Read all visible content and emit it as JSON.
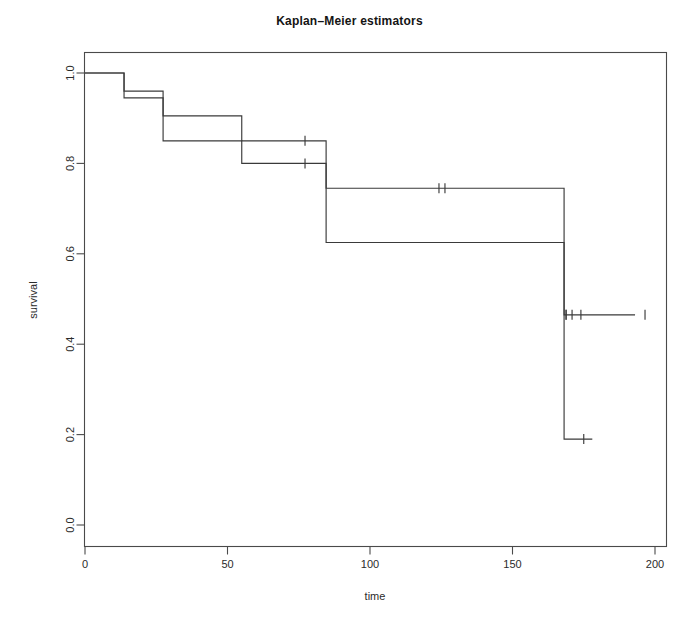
{
  "chart_data": {
    "type": "line",
    "subtype": "kaplan-meier-step",
    "title": "Kaplan–Meier estimators",
    "xlabel": "time",
    "ylabel": "survival",
    "xlim": [
      0,
      200
    ],
    "ylim": [
      0.0,
      1.0
    ],
    "xticks": [
      0,
      50,
      100,
      150,
      200
    ],
    "xtick_labels": [
      "0",
      "50",
      "100",
      "150",
      "200"
    ],
    "yticks": [
      0.0,
      0.2,
      0.4,
      0.6,
      0.8,
      1.0
    ],
    "ytick_labels": [
      "0.0",
      "0.2",
      "0.4",
      "0.6",
      "0.8",
      "1.0"
    ],
    "grid": false,
    "legend": "none",
    "line_color": "#3a3a3a",
    "frame_color": "#4a4a4a",
    "series": [
      {
        "name": "group-1",
        "x": [
          0,
          13.7,
          27.4,
          55.0,
          84.6,
          168.1,
          193.0
        ],
        "y": [
          1.0,
          0.96,
          0.905,
          0.85,
          0.745,
          0.465,
          0.465
        ],
        "censor_x": [
          77.2,
          124.2,
          126.3,
          168.8,
          170.9,
          174.0,
          196.5
        ],
        "censor_y": [
          0.85,
          0.745,
          0.745,
          0.465,
          0.465,
          0.465,
          0.465
        ]
      },
      {
        "name": "group-2",
        "x": [
          0,
          13.7,
          27.4,
          55.0,
          84.6,
          168.1,
          178.0
        ],
        "y": [
          1.0,
          0.945,
          0.85,
          0.8,
          0.625,
          0.19,
          0.19
        ],
        "censor_x": [
          77.2,
          168.8,
          175.0
        ],
        "censor_y": [
          0.8,
          0.465,
          0.19
        ]
      }
    ]
  },
  "axes": {
    "y_axis_label": "survival",
    "x_axis_label": "time"
  }
}
